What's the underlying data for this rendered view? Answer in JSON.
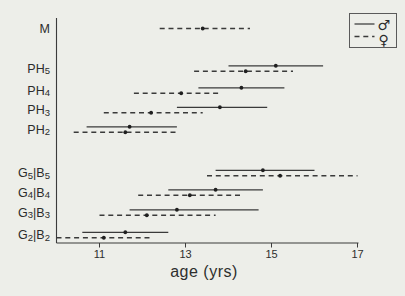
{
  "chart_data": {
    "type": "range-bar",
    "title": "",
    "xlabel": "age (yrs)",
    "ylabel": "",
    "xlim": [
      10,
      17
    ],
    "xticks": [
      11,
      13,
      15,
      17
    ],
    "grid": false,
    "legend": {
      "position": "top-right",
      "male": {
        "symbol": "♂",
        "line_style": "solid"
      },
      "female": {
        "symbol": "♀",
        "line_style": "dashed"
      }
    },
    "rows": [
      {
        "label": "M",
        "label_parts": [
          [
            "M",
            false
          ]
        ],
        "female": {
          "min": 12.4,
          "mean": 13.4,
          "max": 14.5
        }
      },
      {
        "label": "PH5",
        "label_parts": [
          [
            "PH",
            false
          ],
          [
            "5",
            true
          ]
        ],
        "male": {
          "min": 14.0,
          "mean": 15.1,
          "max": 16.2
        },
        "female": {
          "min": 13.2,
          "mean": 14.4,
          "max": 15.5
        }
      },
      {
        "label": "PH4",
        "label_parts": [
          [
            "PH",
            false
          ],
          [
            "4",
            true
          ]
        ],
        "male": {
          "min": 13.3,
          "mean": 14.3,
          "max": 15.3
        },
        "female": {
          "min": 11.8,
          "mean": 12.9,
          "max": 13.8
        }
      },
      {
        "label": "PH3",
        "label_parts": [
          [
            "PH",
            false
          ],
          [
            "3",
            true
          ]
        ],
        "male": {
          "min": 12.8,
          "mean": 13.8,
          "max": 14.9
        },
        "female": {
          "min": 11.1,
          "mean": 12.2,
          "max": 13.4
        }
      },
      {
        "label": "PH2",
        "label_parts": [
          [
            "PH",
            false
          ],
          [
            "2",
            true
          ]
        ],
        "male": {
          "min": 10.7,
          "mean": 11.7,
          "max": 12.8
        },
        "female": {
          "min": 10.4,
          "mean": 11.6,
          "max": 12.8
        }
      },
      {
        "label": "G5|B5",
        "label_parts": [
          [
            "G",
            false
          ],
          [
            "5",
            true
          ],
          [
            "|",
            false
          ],
          [
            "B",
            false
          ],
          [
            "5",
            true
          ]
        ],
        "male": {
          "min": 13.7,
          "mean": 14.8,
          "max": 16.0
        },
        "female": {
          "min": 13.5,
          "mean": 15.2,
          "max": 17.0
        }
      },
      {
        "label": "G4|B4",
        "label_parts": [
          [
            "G",
            false
          ],
          [
            "4",
            true
          ],
          [
            "|",
            false
          ],
          [
            "B",
            false
          ],
          [
            "4",
            true
          ]
        ],
        "male": {
          "min": 12.6,
          "mean": 13.7,
          "max": 14.8
        },
        "female": {
          "min": 11.9,
          "mean": 13.1,
          "max": 14.3
        }
      },
      {
        "label": "G3|B3",
        "label_parts": [
          [
            "G",
            false
          ],
          [
            "3",
            true
          ],
          [
            "|",
            false
          ],
          [
            "B",
            false
          ],
          [
            "3",
            true
          ]
        ],
        "male": {
          "min": 11.7,
          "mean": 12.8,
          "max": 14.7
        },
        "female": {
          "min": 11.0,
          "mean": 12.1,
          "max": 13.7
        }
      },
      {
        "label": "G2|B2",
        "label_parts": [
          [
            "G",
            false
          ],
          [
            "2",
            true
          ],
          [
            "|",
            false
          ],
          [
            "B",
            false
          ],
          [
            "2",
            true
          ]
        ],
        "male": {
          "min": 10.6,
          "mean": 11.6,
          "max": 12.6
        },
        "female": {
          "min": 10.0,
          "mean": 11.1,
          "max": 12.2
        }
      }
    ]
  }
}
